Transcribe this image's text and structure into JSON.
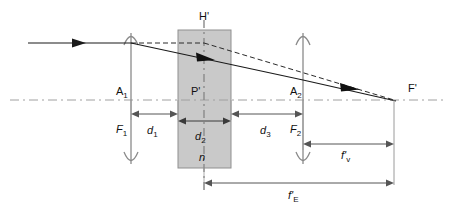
{
  "figure": {
    "background_color": "#ffffff",
    "line_color": "#333333",
    "axis_color": "#9a9a9a",
    "block_fill": "#c9c9c9",
    "block_stroke": "#8a8a8a",
    "ray_color": "#1a1a1a"
  },
  "labels": {
    "principal_plane": "H'",
    "lens1_vertex": "A",
    "lens1_vertex_sub": "1",
    "lens2_vertex": "A",
    "lens2_vertex_sub": "2",
    "lens1_focal": "F",
    "lens1_focal_sub": "1",
    "lens2_focal": "F",
    "lens2_focal_sub": "2",
    "principal_point": "P'",
    "image_focus": "F'",
    "gap1": "d",
    "gap1_sub": "1",
    "block_thickness": "d",
    "block_thickness_sub": "2",
    "gap3": "d",
    "gap3_sub": "3",
    "refractive_index": "n",
    "back_focal": "f'",
    "back_focal_sub": "v",
    "effective_focal": "f'",
    "effective_focal_sub": "E"
  },
  "geometry": {
    "optical_axis_y": 100,
    "lens1_x": 131,
    "lens2_x": 303,
    "block_left_x": 178,
    "block_right_x": 231,
    "block_top_y": 30,
    "block_bottom_y": 168,
    "principal_plane_x": 204,
    "focus_x": 394,
    "incoming_ray_y": 43
  },
  "elements": [
    {
      "name": "incoming-ray",
      "type": "ray",
      "style": "solid"
    },
    {
      "name": "refracted-ray",
      "type": "ray",
      "style": "solid"
    },
    {
      "name": "exit-ray",
      "type": "ray",
      "style": "solid"
    },
    {
      "name": "principal-ray-extension",
      "type": "ray",
      "style": "dashed"
    },
    {
      "name": "optical-axis",
      "type": "axis",
      "style": "dash-dot"
    },
    {
      "name": "glass-block",
      "type": "region",
      "fill": "#c9c9c9"
    }
  ]
}
